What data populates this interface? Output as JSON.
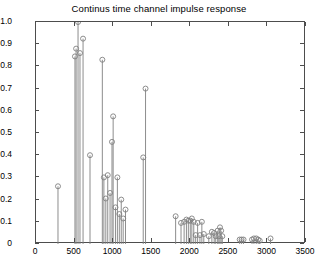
{
  "figure": {
    "title": "Continus time channel impulse response",
    "background": "#ffffff",
    "axis_color": "#4d4d4d",
    "stem_color": "#808080",
    "marker_color": "#808080"
  },
  "chart_data": {
    "type": "stem",
    "title": "Continus time channel impulse response",
    "xlabel": "",
    "ylabel": "",
    "xlim": [
      0,
      3500
    ],
    "ylim": [
      0,
      1.0
    ],
    "xticks": [
      0,
      500,
      1000,
      1500,
      2000,
      2500,
      3000,
      3500
    ],
    "yticks": [
      0,
      0.1,
      0.2,
      0.3,
      0.4,
      0.5,
      0.6,
      0.7,
      0.8,
      0.9,
      1.0
    ],
    "xtick_labels": [
      "0",
      "500",
      "1000",
      "1500",
      "2000",
      "2500",
      "3000",
      "3500"
    ],
    "ytick_labels": [
      "0",
      "0.1",
      "0.2",
      "0.3",
      "0.4",
      "0.5",
      "0.6",
      "0.7",
      "0.8",
      "0.9",
      "1.0"
    ],
    "grid": false,
    "legend": false,
    "marker": "circle-open",
    "x": [
      285,
      505,
      520,
      545,
      570,
      610,
      700,
      860,
      880,
      905,
      930,
      960,
      985,
      1000,
      1030,
      1055,
      1080,
      1105,
      1130,
      1160,
      1390,
      1420,
      1810,
      1880,
      1920,
      1950,
      1975,
      2000,
      2020,
      2045,
      2070,
      2095,
      2125,
      2150,
      2175,
      2240,
      2280,
      2310,
      2330,
      2355,
      2370,
      2385,
      2400,
      2415,
      2640,
      2665,
      2690,
      2800,
      2825,
      2855,
      2880,
      2900,
      3040
    ],
    "y": [
      0.26,
      0.845,
      0.88,
      1.0,
      0.86,
      0.925,
      0.4,
      0.83,
      0.3,
      0.205,
      0.31,
      0.23,
      0.46,
      0.575,
      0.165,
      0.3,
      0.135,
      0.2,
      0.115,
      0.155,
      0.39,
      0.7,
      0.125,
      0.095,
      0.1,
      0.11,
      0.105,
      0.105,
      0.115,
      0.1,
      0.04,
      0.095,
      0.04,
      0.1,
      0.045,
      0.035,
      0.055,
      0.05,
      0.035,
      0.06,
      0.035,
      0.075,
      0.06,
      0.035,
      0.02,
      0.02,
      0.02,
      0.02,
      0.025,
      0.025,
      0.02,
      0.015,
      0.025
    ]
  }
}
